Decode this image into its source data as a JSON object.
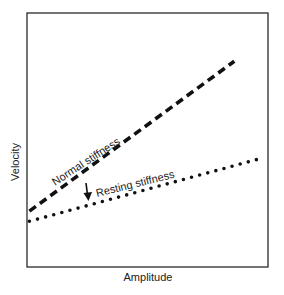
{
  "chart_data": {
    "type": "line",
    "title": "",
    "xlabel": "Amplitude",
    "ylabel": "Velocity",
    "xlim": [
      0,
      10
    ],
    "ylim": [
      0,
      10
    ],
    "grid": false,
    "legend": null,
    "ticks": {
      "x": [],
      "y": []
    },
    "series": [
      {
        "name": "Normal stiffness",
        "style": "dashed",
        "x": [
          0.1,
          8.6
        ],
        "y": [
          2.2,
          8.1
        ]
      },
      {
        "name": "Resting stiffness",
        "style": "dotted",
        "x": [
          0.1,
          9.8
        ],
        "y": [
          1.8,
          4.3
        ]
      }
    ],
    "annotations": [
      {
        "text": "Normal stiffness",
        "type": "line-label"
      },
      {
        "text": "Resting stiffness",
        "type": "line-label"
      },
      {
        "text": "",
        "type": "arrow",
        "meaning": "shift from normal to resting stiffness (downward)"
      }
    ]
  },
  "labels": {
    "xlabel": "Amplitude",
    "ylabel": "Velocity",
    "normal": "Normal stiffness",
    "resting": "Resting stiffness"
  },
  "colors": {
    "line": "#111111",
    "frame": "#2a2a2a",
    "text": "#222222",
    "background": "#ffffff"
  }
}
